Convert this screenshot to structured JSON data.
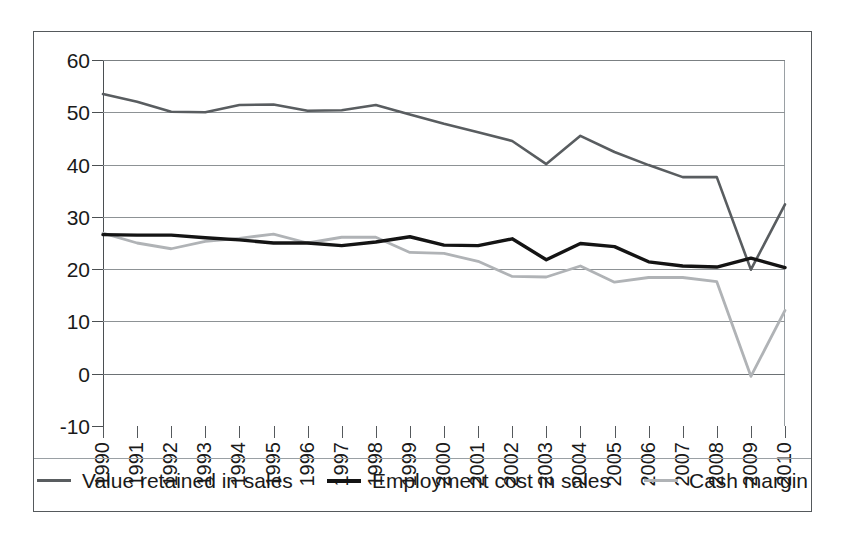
{
  "chart_data": {
    "type": "line",
    "title": "",
    "subtitle": "",
    "xlabel": "",
    "ylabel": "",
    "grid": true,
    "legend_position": "bottom",
    "ylim": [
      -10,
      60
    ],
    "yticks": [
      -10,
      0,
      10,
      20,
      30,
      40,
      50,
      60
    ],
    "ytick_labels": [
      "-10",
      "0",
      "10",
      "20",
      "30",
      "40",
      "50",
      "60"
    ],
    "categories": [
      "1990",
      "1991",
      "1992",
      "1993",
      "1994",
      "1995",
      "1996",
      "1997",
      "1998",
      "1999",
      "2000",
      "2001",
      "2002",
      "2003",
      "2004",
      "2005",
      "2006",
      "2007",
      "2008",
      "2009",
      "2010"
    ],
    "series": [
      {
        "name": "Value retained in sales",
        "color": "#595d60",
        "width": 2.6,
        "values": [
          53.5,
          52.0,
          50.1,
          50.0,
          51.4,
          51.5,
          50.3,
          50.4,
          51.4,
          49.6,
          47.8,
          46.2,
          44.5,
          40.1,
          45.5,
          42.4,
          39.9,
          37.6,
          37.6,
          19.9,
          32.4
        ]
      },
      {
        "name": "Employment cost in sales",
        "color": "#141414",
        "width": 3.4,
        "values": [
          26.6,
          26.5,
          26.5,
          26.0,
          25.6,
          25.0,
          25.0,
          24.5,
          25.2,
          26.2,
          24.6,
          24.5,
          25.8,
          21.8,
          24.9,
          24.3,
          21.4,
          20.6,
          20.4,
          22.1,
          20.3
        ]
      },
      {
        "name": "Cash margin",
        "color": "#b0b3b6",
        "width": 2.8,
        "values": [
          26.9,
          25.0,
          23.9,
          25.3,
          25.9,
          26.7,
          25.0,
          26.1,
          26.1,
          23.2,
          23.0,
          21.5,
          18.6,
          18.5,
          20.6,
          17.5,
          18.4,
          18.4,
          17.6,
          -0.5,
          12.1
        ]
      }
    ]
  },
  "legend": {
    "entries": [
      {
        "label": "Value retained in sales",
        "color": "#595d60",
        "swatch": "legend-line-value-retained"
      },
      {
        "label": "Employment cost in sales",
        "color": "#141414",
        "swatch": "legend-line-employment-cost"
      },
      {
        "label": "Cash margin",
        "color": "#b0b3b6",
        "swatch": "legend-line-cash-margin"
      }
    ]
  }
}
